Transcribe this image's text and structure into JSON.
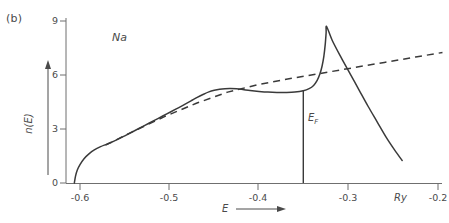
{
  "panel": {
    "label": "(b)"
  },
  "annotations": {
    "sample": "Na",
    "fermi_level": "E",
    "fermi_level_sub": "F",
    "unit": "Ry"
  },
  "axes": {
    "xlabel": "E",
    "ylabel": "n(E)",
    "x_ticks": [
      "-0.6",
      "-0.5",
      "-0.4",
      "-0.3",
      "-0.2"
    ],
    "y_ticks": [
      "9",
      "6",
      "3",
      "0"
    ]
  },
  "chart_data": {
    "type": "line",
    "title": "",
    "subtitle": "",
    "xlabel": "E",
    "ylabel": "n(E)",
    "xunit": "Ry",
    "xlim": [
      -0.632,
      -0.188
    ],
    "ylim": [
      0,
      9.6
    ],
    "xticks": [
      -0.6,
      -0.5,
      -0.4,
      -0.3,
      -0.2
    ],
    "xticklabels": [
      "-0.6",
      "-0.5",
      "-0.4",
      "-0.3",
      "-0.2"
    ],
    "yticks": [
      0,
      3,
      6,
      9
    ],
    "yticklabels": [
      "0",
      "3",
      "6",
      "9"
    ],
    "grid": false,
    "legend": null,
    "annotations": [
      {
        "text": "(b)",
        "role": "panel-label",
        "x": -0.631,
        "y": 9.5
      },
      {
        "text": "Na",
        "role": "sample-label",
        "x": -0.556,
        "y": 8.25
      },
      {
        "text": "E_F",
        "role": "fermi-level-label",
        "x": -0.374,
        "y": 3.0
      },
      {
        "text": "Ry",
        "role": "x-unit",
        "x": -0.248,
        "y": -0.85
      }
    ],
    "vertical_lines": [
      {
        "name": "fermi-level",
        "x": -0.3505,
        "y_from": 0,
        "y_to": 5.15,
        "style": "solid"
      }
    ],
    "series": [
      {
        "name": "density-of-states",
        "style": "solid",
        "color": "#3a3a3a",
        "points": [
          [
            -0.6063,
            0.0
          ],
          [
            -0.605,
            0.38
          ],
          [
            -0.603,
            0.72
          ],
          [
            -0.6,
            1.02
          ],
          [
            -0.5955,
            1.35
          ],
          [
            -0.59,
            1.62
          ],
          [
            -0.584,
            1.84
          ],
          [
            -0.577,
            2.02
          ],
          [
            -0.57,
            2.16
          ],
          [
            -0.562,
            2.33
          ],
          [
            -0.553,
            2.55
          ],
          [
            -0.543,
            2.8
          ],
          [
            -0.533,
            3.06
          ],
          [
            -0.523,
            3.32
          ],
          [
            -0.513,
            3.58
          ],
          [
            -0.503,
            3.84
          ],
          [
            -0.493,
            4.1
          ],
          [
            -0.484,
            4.34
          ],
          [
            -0.476,
            4.56
          ],
          [
            -0.469,
            4.76
          ],
          [
            -0.462,
            4.93
          ],
          [
            -0.456,
            5.06
          ],
          [
            -0.45,
            5.15
          ],
          [
            -0.444,
            5.21
          ],
          [
            -0.438,
            5.24
          ],
          [
            -0.432,
            5.25
          ],
          [
            -0.425,
            5.23
          ],
          [
            -0.418,
            5.19
          ],
          [
            -0.41,
            5.14
          ],
          [
            -0.4,
            5.09
          ],
          [
            -0.39,
            5.05
          ],
          [
            -0.38,
            5.03
          ],
          [
            -0.37,
            5.03
          ],
          [
            -0.36,
            5.05
          ],
          [
            -0.3505,
            5.12
          ],
          [
            -0.344,
            5.24
          ],
          [
            -0.339,
            5.42
          ],
          [
            -0.335,
            5.7
          ],
          [
            -0.332,
            6.05
          ],
          [
            -0.3295,
            6.5
          ],
          [
            -0.3275,
            7.05
          ],
          [
            -0.326,
            7.7
          ],
          [
            -0.325,
            8.35
          ],
          [
            -0.3245,
            8.7
          ],
          [
            -0.318,
            7.9
          ],
          [
            -0.308,
            6.95
          ],
          [
            -0.298,
            6.05
          ],
          [
            -0.288,
            5.15
          ],
          [
            -0.278,
            4.25
          ],
          [
            -0.268,
            3.4
          ],
          [
            -0.258,
            2.55
          ],
          [
            -0.248,
            1.8
          ],
          [
            -0.24,
            1.25
          ]
        ]
      },
      {
        "name": "free-electron-parabola",
        "style": "dashed",
        "color": "#3a3a3a",
        "points": [
          [
            -0.5715,
            2.1
          ],
          [
            -0.54,
            2.88
          ],
          [
            -0.505,
            3.7
          ],
          [
            -0.47,
            4.43
          ],
          [
            -0.435,
            5.05
          ],
          [
            -0.4,
            5.48
          ],
          [
            -0.365,
            5.8
          ],
          [
            -0.33,
            6.1
          ],
          [
            -0.295,
            6.4
          ],
          [
            -0.26,
            6.7
          ],
          [
            -0.225,
            7.0
          ],
          [
            -0.195,
            7.25
          ]
        ]
      }
    ]
  }
}
